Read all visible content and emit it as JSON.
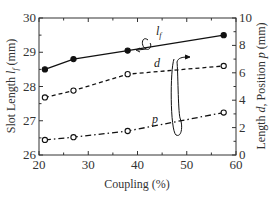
{
  "chart_data": {
    "type": "line",
    "title": "",
    "xlabel": "Coupling (%)",
    "ylabel_left": "Slot Length l_f (mm)",
    "ylabel_right": "Length d, Position p (mm)",
    "xlim": [
      20,
      60
    ],
    "ylim_left": [
      26,
      30
    ],
    "ylim_right": [
      0,
      10
    ],
    "x_ticks": [
      "20",
      "30",
      "40",
      "50",
      "60"
    ],
    "y_ticks_left": [
      "26",
      "27",
      "28",
      "29",
      "30"
    ],
    "y_ticks_right": [
      "0",
      "2",
      "4",
      "6",
      "8",
      "10"
    ],
    "grid": false,
    "legend": "inline annotations with arrows pointing to axes",
    "x": [
      21.2,
      27,
      38,
      57.5
    ],
    "series": [
      {
        "name": "l_f",
        "axis": "left",
        "style": "solid",
        "marker": "filled-circle",
        "values": [
          28.5,
          28.8,
          29.05,
          29.5
        ]
      },
      {
        "name": "d",
        "axis": "right",
        "style": "dashed",
        "marker": "open-circle",
        "values": [
          4.2,
          4.7,
          5.9,
          6.5
        ]
      },
      {
        "name": "p",
        "axis": "right",
        "style": "dash-dot",
        "marker": "open-circle",
        "values": [
          1.1,
          1.3,
          1.75,
          3.1
        ]
      }
    ],
    "annotations": [
      {
        "text": "l_f",
        "arrow": "to left axis"
      },
      {
        "text": "d",
        "arrow": "to right axis"
      },
      {
        "text": "p",
        "arrow": "to right axis"
      }
    ]
  },
  "labels": {
    "xlabel": "Coupling (%)",
    "ylabel_left_prefix": "Slot Length ",
    "ylabel_left_var": "l",
    "ylabel_left_sub": "f",
    "ylabel_left_suffix": " (mm)",
    "ylabel_right_prefix": "Length ",
    "ylabel_right_var1": "d",
    "ylabel_right_mid": ", Position ",
    "ylabel_right_var2": "p",
    "ylabel_right_suffix": " (mm)",
    "series_lf": "l",
    "series_lf_sub": "f",
    "series_d": "d",
    "series_p": "p"
  }
}
